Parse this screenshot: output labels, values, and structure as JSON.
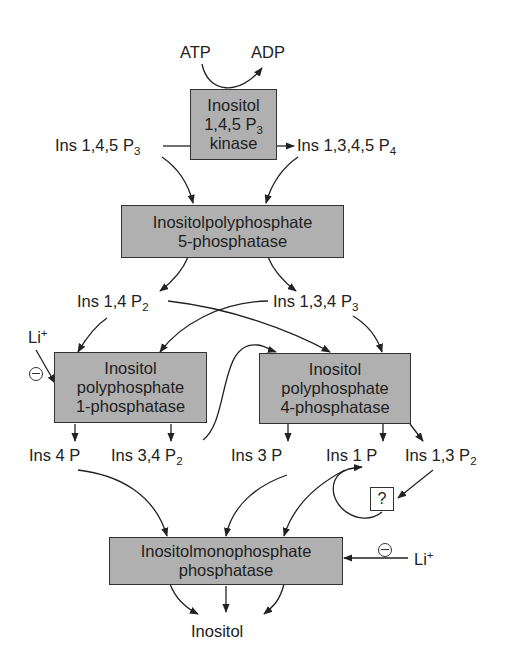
{
  "diagram": {
    "colors": {
      "enzyme_box": "#b0b0b0",
      "line": "#222222",
      "background": "#ffffff"
    },
    "cofactors": {
      "atp": "ATP",
      "adp": "ADP"
    },
    "enzymes": {
      "kinase": {
        "line1": "Inositol",
        "line2_base": "1,4,5 P",
        "line2_sub": "3",
        "line3": "kinase"
      },
      "phosphatase5": {
        "line1": "Inositolpolyphosphate",
        "line2": "5-phosphatase"
      },
      "phosphatase1": {
        "line1": "Inositol",
        "line2": "polyphosphate",
        "line3": "1-phosphatase"
      },
      "phosphatase4": {
        "line1": "Inositol",
        "line2": "polyphosphate",
        "line3": "4-phosphatase"
      },
      "monophosphatase": {
        "line1": "Inositolmonophosphate",
        "line2": "phosphatase"
      }
    },
    "metabolites": {
      "ins145p3": {
        "base": "Ins 1,4,5 P",
        "sub": "3"
      },
      "ins1345p4": {
        "base": "Ins 1,3,4,5 P",
        "sub": "4"
      },
      "ins14p2": {
        "base": "Ins 1,4 P",
        "sub": "2"
      },
      "ins134p3": {
        "base": "Ins 1,3,4 P",
        "sub": "3"
      },
      "ins4p": {
        "base": "Ins 4 P"
      },
      "ins34p2": {
        "base": "Ins 3,4 P",
        "sub": "2"
      },
      "ins3p": {
        "base": "Ins 3 P"
      },
      "ins1p": {
        "base": "Ins 1 P"
      },
      "ins13p2": {
        "base": "Ins 1,3 P",
        "sub": "2"
      },
      "inositol": {
        "base": "Inositol"
      }
    },
    "inhibitors": {
      "li_top": {
        "base": "Li",
        "sup": "+"
      },
      "li_bottom": {
        "base": "Li",
        "sup": "+"
      }
    },
    "unknown_step": "?"
  }
}
